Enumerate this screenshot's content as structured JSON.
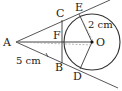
{
  "diagram": {
    "type": "geometry",
    "points": {
      "A": {
        "label": "A",
        "x": 16,
        "y": 42
      },
      "O": {
        "label": "O",
        "x": 92,
        "y": 42
      },
      "E": {
        "label": "E",
        "x": 79,
        "y": 14
      },
      "D": {
        "label": "D",
        "x": 80,
        "y": 69
      },
      "C": {
        "label": "C",
        "x": 62,
        "y": 20
      },
      "B": {
        "label": "B",
        "x": 62,
        "y": 63
      },
      "F": {
        "label": "F",
        "x": 62,
        "y": 42
      }
    },
    "circle": {
      "center": "O",
      "radius": 28
    },
    "measurements": {
      "radius_label": "2 cm",
      "ab_label": "5 cm"
    },
    "colors": {
      "line": "#333333",
      "dashed": "#888888",
      "text": "#222222"
    }
  }
}
